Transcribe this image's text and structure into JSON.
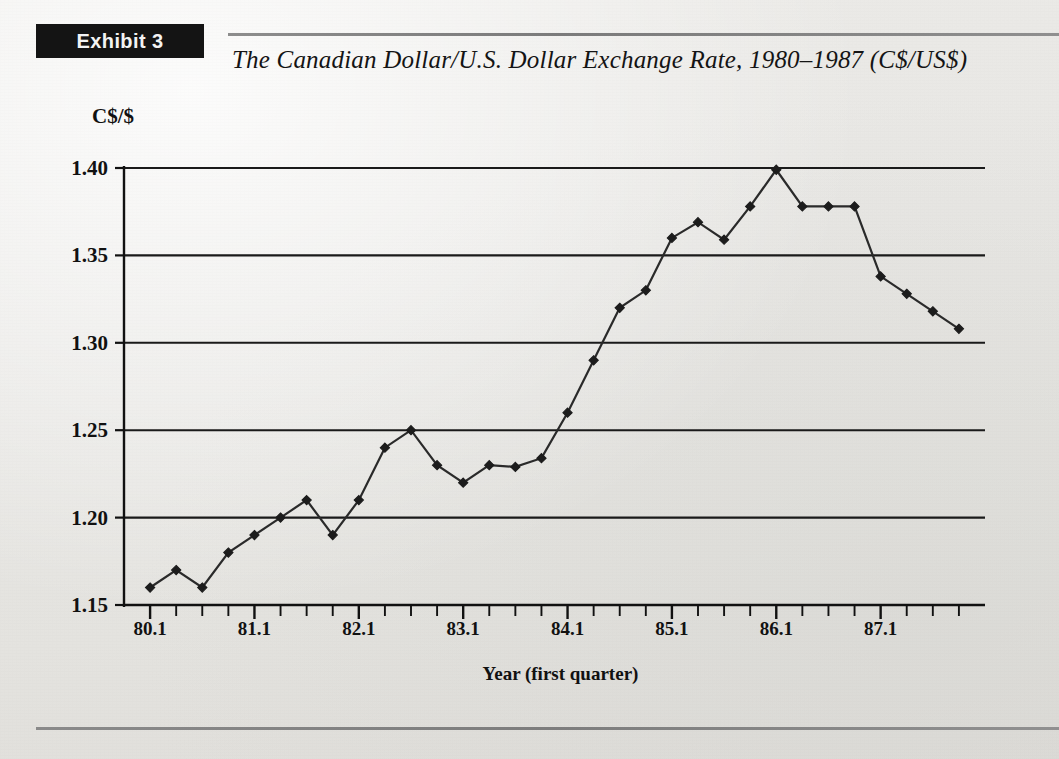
{
  "header": {
    "exhibit_badge": "Exhibit 3",
    "title": "The Canadian Dollar/U.S. Dollar Exchange Rate, 1980–1987 (C$/US$)"
  },
  "colors": {
    "page_background": "#e8e7e4",
    "badge_background": "#141414",
    "badge_text": "#f3f3f3",
    "rule": "#838383",
    "axis": "#111111",
    "gridline": "#1a1a1a",
    "series_line": "#2a2a2a",
    "marker": "#1c1c1c"
  },
  "chart_data": {
    "type": "line",
    "title": "The Canadian Dollar/U.S. Dollar Exchange Rate, 1980–1987 (C$/US$)",
    "xlabel": "Year (first quarter)",
    "ylabel": "C$/$",
    "ylim": [
      1.15,
      1.4
    ],
    "yticks": [
      1.15,
      1.2,
      1.25,
      1.3,
      1.35,
      1.4
    ],
    "ytick_labels": [
      "1.15",
      "1.20",
      "1.25",
      "1.30",
      "1.35",
      "1.40"
    ],
    "xtick_labels": [
      "80.1",
      "81.1",
      "82.1",
      "83.1",
      "84.1",
      "85.1",
      "86.1",
      "87.1"
    ],
    "xtick_positions": [
      0,
      4,
      8,
      12,
      16,
      20,
      24,
      28
    ],
    "minor_xticks_per_label": 4,
    "x": [
      "80.1",
      "80.2",
      "80.3",
      "80.4",
      "81.1",
      "81.2",
      "81.3",
      "81.4",
      "82.1",
      "82.2",
      "82.3",
      "82.4",
      "83.1",
      "83.2",
      "83.3",
      "83.4",
      "84.1",
      "84.2",
      "84.3",
      "84.4",
      "85.1",
      "85.2",
      "85.3",
      "85.4",
      "86.1",
      "86.2",
      "86.3",
      "86.4",
      "87.1",
      "87.2",
      "87.3",
      "87.4"
    ],
    "values": [
      1.16,
      1.17,
      1.16,
      1.18,
      1.19,
      1.2,
      1.21,
      1.19,
      1.21,
      1.24,
      1.25,
      1.23,
      1.22,
      1.23,
      1.229,
      1.234,
      1.26,
      1.29,
      1.32,
      1.33,
      1.36,
      1.369,
      1.359,
      1.378,
      1.399,
      1.378,
      1.378,
      1.378,
      1.338,
      1.328,
      1.318,
      1.308
    ],
    "series": [
      {
        "name": "C$/US$ exchange rate",
        "values": [
          1.16,
          1.17,
          1.16,
          1.18,
          1.19,
          1.2,
          1.21,
          1.19,
          1.21,
          1.24,
          1.25,
          1.23,
          1.22,
          1.23,
          1.229,
          1.234,
          1.26,
          1.29,
          1.32,
          1.33,
          1.36,
          1.369,
          1.359,
          1.378,
          1.399,
          1.378,
          1.378,
          1.378,
          1.338,
          1.328,
          1.318,
          1.308
        ]
      }
    ],
    "grid": true,
    "grid_axis": "y",
    "markers": "diamond",
    "legend": false,
    "legend_position": "none"
  }
}
